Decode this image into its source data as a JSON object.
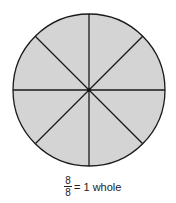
{
  "diagram": {
    "type": "fraction-circle",
    "slices": 8,
    "fill_color": "#d4d4d4",
    "stroke_color": "#1a1a1a",
    "center": [
      89,
      90
    ],
    "radius": 76
  },
  "caption": {
    "numerator": "8",
    "denominator": "8",
    "text": "= 1 whole"
  }
}
